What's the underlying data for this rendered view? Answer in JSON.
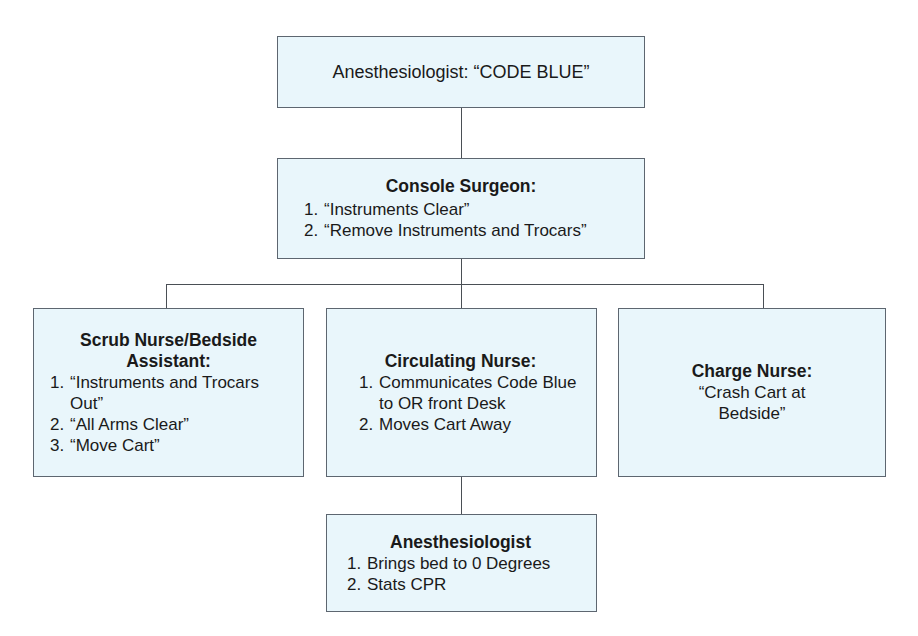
{
  "diagram": {
    "nodes": {
      "top": {
        "text": "Anesthesiologist: “CODE BLUE”"
      },
      "console_surgeon": {
        "title": "Console Surgeon:",
        "items": [
          {
            "num": "1.",
            "text": "“Instruments Clear”"
          },
          {
            "num": "2.",
            "text": "“Remove Instruments and Trocars”"
          }
        ]
      },
      "scrub_nurse": {
        "title_line1": "Scrub Nurse/Bedside",
        "title_line2": "Assistant:",
        "items": [
          {
            "num": "1.",
            "text": "“Instruments and Trocars Out”"
          },
          {
            "num": "2.",
            "text": "“All Arms Clear”"
          },
          {
            "num": "3.",
            "text": "“Move Cart”"
          }
        ]
      },
      "circulating_nurse": {
        "title": "Circulating Nurse:",
        "items": [
          {
            "num": "1.",
            "text": "Communicates Code Blue to OR front Desk"
          },
          {
            "num": "2.",
            "text": "Moves Cart Away"
          }
        ]
      },
      "charge_nurse": {
        "title": "Charge Nurse:",
        "text_line1": "“Crash Cart at",
        "text_line2": "Bedside”"
      },
      "anesthesiologist_action": {
        "title": "Anesthesiologist",
        "items": [
          {
            "num": "1.",
            "text": "Brings bed to 0 Degrees"
          },
          {
            "num": "2.",
            "text": "Stats CPR"
          }
        ]
      }
    },
    "edges": [
      {
        "from": "top",
        "to": "console_surgeon"
      },
      {
        "from": "console_surgeon",
        "to": "scrub_nurse"
      },
      {
        "from": "console_surgeon",
        "to": "circulating_nurse"
      },
      {
        "from": "console_surgeon",
        "to": "charge_nurse"
      },
      {
        "from": "circulating_nurse",
        "to": "anesthesiologist_action"
      }
    ],
    "colors": {
      "box_fill": "#e9f6fb",
      "box_border": "#5d6670",
      "connector": "#4a4f55",
      "text": "#1a1a1a"
    }
  }
}
